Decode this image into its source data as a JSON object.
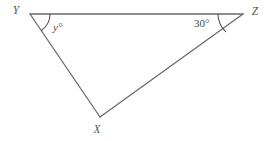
{
  "figure": {
    "type": "geometry-triangle-diagram",
    "background_color": "#ffffff",
    "stroke_color": "#6a6a6a",
    "arc_color": "#555555",
    "text_color": "#4a4a4a",
    "canvas": {
      "width": 270,
      "height": 141
    },
    "vertices": [
      {
        "name": "Y",
        "label": "Y",
        "x": 30,
        "y": 14,
        "label_x": 16,
        "label_y": 14
      },
      {
        "name": "Z",
        "label": "Z",
        "x": 243,
        "y": 14,
        "label_x": 255,
        "label_y": 15
      },
      {
        "name": "X",
        "label": "X",
        "x": 100,
        "y": 117,
        "label_x": 97,
        "label_y": 133
      }
    ],
    "sides": [
      {
        "name": "side-YZ",
        "from": "Y",
        "to": "Z",
        "path": "M 30 14 L 243 14"
      },
      {
        "name": "side-YX",
        "from": "Y",
        "to": "X",
        "path": "M 30 14 L 100 117"
      },
      {
        "name": "side-XZ",
        "from": "X",
        "to": "Z",
        "path": "M 100 117 L 243 14"
      }
    ],
    "angles": [
      {
        "name": "angle-at-Y",
        "vertex": "Y",
        "label": "y°",
        "italic": true,
        "label_x": 53,
        "label_y": 31,
        "arc_path": "M 50 14 A 20 20 0 0 1 41.6 30.3"
      },
      {
        "name": "angle-at-Z",
        "vertex": "Z",
        "label": "30°",
        "italic": false,
        "label_x": 194,
        "label_y": 27,
        "arc_path": "M 218 14 A 25 25 0 0 0 225.6 31.6"
      }
    ]
  }
}
